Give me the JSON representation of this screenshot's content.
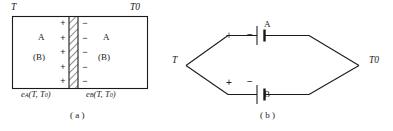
{
  "figure": {
    "panels": [
      {
        "id": "a",
        "caption": "( a )",
        "temperature_left": "T",
        "temperature_right": "T",
        "temperature_right_sub": "0",
        "left_region": {
          "material_primary": "A",
          "material_secondary": "(B)",
          "charge_sign": "+"
        },
        "right_region": {
          "material_primary": "A",
          "material_secondary": "(B)",
          "charge_sign": "−"
        },
        "junction": {
          "name": "hatched-interface",
          "sign_pair_count": 5
        },
        "emf_left": "e",
        "emf_left_sub": "A",
        "emf_left_args": "(T, T",
        "emf_left_args_sub": "0",
        "emf_left_args_tail": ")",
        "emf_right": "e",
        "emf_right_sub": "B",
        "emf_right_args": "(T, T",
        "emf_right_args_sub": "0",
        "emf_right_args_tail": ")"
      },
      {
        "id": "b",
        "caption": "( b )",
        "temperature_left": "T",
        "temperature_right": "T",
        "temperature_right_sub": "0",
        "top_branch": {
          "label": "A",
          "terminal_positive": "+",
          "terminal_negative": "−"
        },
        "bottom_branch": {
          "label": "B",
          "terminal_positive": "+",
          "terminal_negative": "−"
        }
      }
    ],
    "colors": {
      "stroke": "#1a1a1a",
      "text": "#1a1a1a",
      "background": "#ffffff",
      "hatch": "#2b2b2b"
    }
  }
}
